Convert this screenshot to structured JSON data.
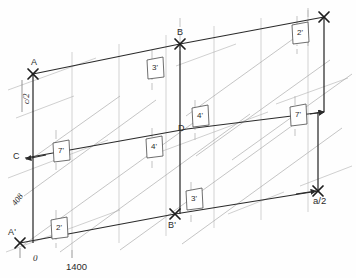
{
  "drawing": {
    "type": "axonometric-survey-diagram",
    "background_color": "#fefefe",
    "ink_color": "#2b2b2b",
    "light_ink_color": "#a8a8a8",
    "points": [
      {
        "id": "A",
        "label": "A",
        "x": 33,
        "y": 74
      },
      {
        "id": "B",
        "label": "B",
        "x": 180,
        "y": 44
      },
      {
        "id": "C",
        "label": "C",
        "x": 25,
        "y": 158
      },
      {
        "id": "D",
        "label": "D",
        "x": 187,
        "y": 129
      },
      {
        "id": "Ap",
        "label": "A'",
        "x": 20,
        "y": 243
      },
      {
        "id": "Bp",
        "label": "B'",
        "x": 175,
        "y": 214
      }
    ],
    "dimensions": [
      {
        "id": "c-over-2",
        "label": "c/2",
        "orientation": "vertical",
        "x": 22,
        "y": 95
      },
      {
        "id": "offset",
        "label": "408",
        "orientation": "diagonal",
        "x": 10,
        "y": 202
      },
      {
        "id": "baseline",
        "label": "1400",
        "orientation": "horizontal",
        "x": 66,
        "y": 262
      },
      {
        "id": "a-over-2",
        "label": "a/2",
        "orientation": "horizontal",
        "x": 313,
        "y": 196
      },
      {
        "id": "origin",
        "label": "0",
        "orientation": "horizontal",
        "x": 33,
        "y": 256
      }
    ],
    "tags": [
      {
        "id": "tag-3-top",
        "label": "3'",
        "x": 152,
        "y": 68
      },
      {
        "id": "tag-2-topright",
        "label": "2'",
        "x": 297,
        "y": 33
      },
      {
        "id": "tag-4-mid",
        "label": "4'",
        "x": 197,
        "y": 116
      },
      {
        "id": "tag-7-right",
        "label": "7'",
        "x": 295,
        "y": 115
      },
      {
        "id": "tag-7-left",
        "label": "7'",
        "x": 58,
        "y": 151
      },
      {
        "id": "tag-4-center",
        "label": "4'",
        "x": 151,
        "y": 147
      },
      {
        "id": "tag-2-bottom",
        "label": "2'",
        "x": 56,
        "y": 228
      },
      {
        "id": "tag-3-bottom",
        "label": "3'",
        "x": 191,
        "y": 199
      }
    ],
    "caption": {
      "text": ""
    }
  }
}
